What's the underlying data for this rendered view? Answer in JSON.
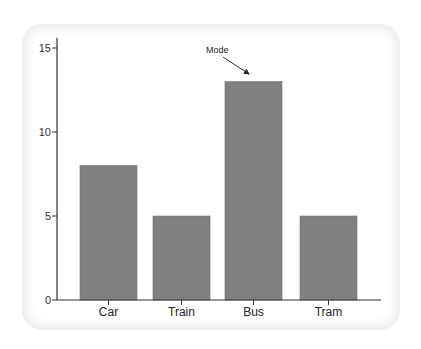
{
  "chart_data": {
    "type": "bar",
    "title": "",
    "xlabel": "",
    "ylabel": "",
    "categories": [
      "Car",
      "Train",
      "Bus",
      "Tram"
    ],
    "values": [
      8,
      5,
      13,
      5
    ],
    "ylim": [
      0,
      15
    ],
    "yticks": [
      0,
      5,
      10,
      15
    ],
    "grid": false,
    "legend": null,
    "bar_color": "#808080",
    "annotations": [
      {
        "text": "Mode",
        "target_category": "Bus",
        "target_value": 13,
        "arrow": true
      }
    ]
  },
  "labels": {
    "yticks": [
      "0",
      "5",
      "10",
      "15"
    ],
    "categories": [
      "Car",
      "Train",
      "Bus",
      "Tram"
    ],
    "annotation": "Mode"
  }
}
